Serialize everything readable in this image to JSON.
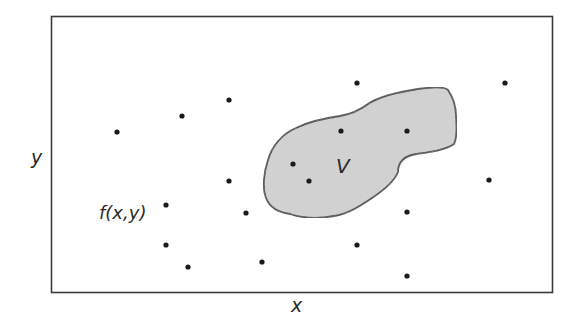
{
  "diagram": {
    "type": "region-in-plane",
    "axis_labels": {
      "x": "x",
      "y": "y"
    },
    "function_label": "f(x,y)",
    "region_label": "V",
    "colors": {
      "frame": "#3a3a3a",
      "region_fill": "#d6d6d6",
      "region_stroke": "#3a3a3a",
      "dot": "#1a1a1a",
      "text": "#2a2a2a",
      "background": "#ffffff"
    },
    "frame": {
      "x": 51,
      "y": 16,
      "width": 501,
      "height": 276
    },
    "sample_points": [
      {
        "x": 117,
        "y": 132,
        "inside_region": false
      },
      {
        "x": 182,
        "y": 116,
        "inside_region": false
      },
      {
        "x": 229,
        "y": 100,
        "inside_region": false
      },
      {
        "x": 357,
        "y": 83,
        "inside_region": false
      },
      {
        "x": 505,
        "y": 83,
        "inside_region": false
      },
      {
        "x": 341,
        "y": 131,
        "inside_region": true
      },
      {
        "x": 407,
        "y": 131,
        "inside_region": true
      },
      {
        "x": 293,
        "y": 164,
        "inside_region": true
      },
      {
        "x": 309,
        "y": 181,
        "inside_region": true
      },
      {
        "x": 229,
        "y": 181,
        "inside_region": false
      },
      {
        "x": 489,
        "y": 180,
        "inside_region": false
      },
      {
        "x": 166,
        "y": 205,
        "inside_region": false
      },
      {
        "x": 246,
        "y": 213,
        "inside_region": false
      },
      {
        "x": 407,
        "y": 212,
        "inside_region": false
      },
      {
        "x": 166,
        "y": 245,
        "inside_region": false
      },
      {
        "x": 357,
        "y": 245,
        "inside_region": false
      },
      {
        "x": 262,
        "y": 262,
        "inside_region": false
      },
      {
        "x": 188,
        "y": 267,
        "inside_region": false
      },
      {
        "x": 407,
        "y": 276,
        "inside_region": false
      }
    ]
  }
}
